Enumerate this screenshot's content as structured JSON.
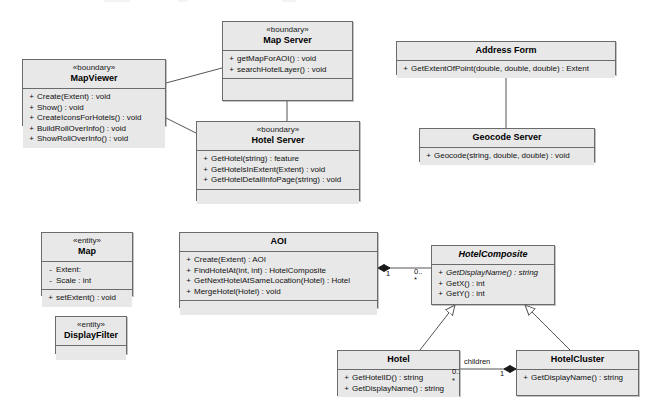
{
  "diagram": {
    "type": "uml-class-diagram",
    "background_color": "#ffffff",
    "class_fill_color": "#e8e8e8",
    "class_border_color": "#6b6b6b",
    "line_color": "#555555"
  },
  "classes": [
    {
      "id": "map_server",
      "name": "Map Server",
      "stereotype": "«boundary»",
      "abstract": false,
      "attributes": [],
      "operations": [
        {
          "visibility": "+",
          "signature": "getMapForAOI() : void"
        },
        {
          "visibility": "+",
          "signature": "searchHotelLayer() : void"
        }
      ],
      "has_empty_compartment": true
    },
    {
      "id": "map_viewer",
      "name": "MapViewer",
      "stereotype": "«boundary»",
      "abstract": false,
      "attributes": [],
      "operations": [
        {
          "visibility": "+",
          "signature": "Create(Extent) : void"
        },
        {
          "visibility": "+",
          "signature": "Show() : void"
        },
        {
          "visibility": "+",
          "signature": "CreateIconsForHotels() : void"
        },
        {
          "visibility": "+",
          "signature": "BuildRollOverInfo() : void"
        },
        {
          "visibility": "+",
          "signature": "ShowRollOverInfo() : void"
        }
      ],
      "has_empty_compartment": false
    },
    {
      "id": "hotel_server",
      "name": "Hotel Server",
      "stereotype": "«boundary»",
      "abstract": false,
      "attributes": [],
      "operations": [
        {
          "visibility": "+",
          "signature": "GetHotel(string) : feature"
        },
        {
          "visibility": "+",
          "signature": "GetHotelsInExtent(Extent) : void"
        },
        {
          "visibility": "+",
          "signature": "GetHotelDetailInfoPage(string) : void"
        }
      ],
      "has_empty_compartment": true
    },
    {
      "id": "address_form",
      "name": "Address Form",
      "stereotype": "",
      "abstract": false,
      "attributes": [],
      "operations": [
        {
          "visibility": "+",
          "signature": "GetExtentOfPoint(double, double, double) : Extent"
        }
      ],
      "has_empty_compartment": false
    },
    {
      "id": "geocode_server",
      "name": "Geocode Server",
      "stereotype": "",
      "abstract": false,
      "attributes": [],
      "operations": [
        {
          "visibility": "+",
          "signature": "Geocode(string, double, double) : void"
        }
      ],
      "has_empty_compartment": false
    },
    {
      "id": "map",
      "name": "Map",
      "stereotype": "«entity»",
      "abstract": false,
      "attributes": [
        {
          "visibility": "-",
          "signature": "Extent:"
        },
        {
          "visibility": "-",
          "signature": "Scale : int"
        }
      ],
      "operations": [
        {
          "visibility": "+",
          "signature": "setExtent() : void"
        }
      ],
      "has_empty_compartment": false
    },
    {
      "id": "display_filter",
      "name": "DisplayFilter",
      "stereotype": "«entity»",
      "abstract": false,
      "attributes": [],
      "operations": [],
      "has_empty_compartment": true
    },
    {
      "id": "aoi",
      "name": "AOI",
      "stereotype": "",
      "abstract": false,
      "attributes": [],
      "operations": [
        {
          "visibility": "+",
          "signature": "Create(Extent) : AOI"
        },
        {
          "visibility": "+",
          "signature": "FindHotelAt(int, int) : HotelComposite"
        },
        {
          "visibility": "+",
          "signature": "GetNextHotelAtSameLocation(Hotel) : Hotel"
        },
        {
          "visibility": "+",
          "signature": "MergeHotel(Hotel) : void"
        }
      ],
      "has_empty_compartment": true
    },
    {
      "id": "hotel_composite",
      "name": "HotelComposite",
      "stereotype": "",
      "abstract": true,
      "attributes": [],
      "operations": [
        {
          "visibility": "+",
          "signature": "GetDisplayName() : string",
          "italic": true
        },
        {
          "visibility": "+",
          "signature": "GetX() : int"
        },
        {
          "visibility": "+",
          "signature": "GetY() : int"
        }
      ],
      "has_empty_compartment": false
    },
    {
      "id": "hotel",
      "name": "Hotel",
      "stereotype": "",
      "abstract": false,
      "attributes": [],
      "operations": [
        {
          "visibility": "+",
          "signature": "GetHotelID() : string"
        },
        {
          "visibility": "+",
          "signature": "GetDisplayName() : string"
        }
      ],
      "has_empty_compartment": false
    },
    {
      "id": "hotel_cluster",
      "name": "HotelCluster",
      "stereotype": "",
      "abstract": false,
      "attributes": [],
      "operations": [
        {
          "visibility": "+",
          "signature": "GetDisplayName() : string"
        }
      ],
      "has_empty_compartment": false
    }
  ],
  "relationships": [
    {
      "id": "r1",
      "from": "map_viewer",
      "to": "map_server",
      "kind": "association",
      "label": "",
      "source_multiplicity": "",
      "target_multiplicity": ""
    },
    {
      "id": "r2",
      "from": "map_viewer",
      "to": "hotel_server",
      "kind": "association",
      "label": "",
      "source_multiplicity": "",
      "target_multiplicity": ""
    },
    {
      "id": "r3",
      "from": "map_server",
      "to": "hotel_server",
      "kind": "association",
      "label": "",
      "source_multiplicity": "",
      "target_multiplicity": ""
    },
    {
      "id": "r4",
      "from": "address_form",
      "to": "geocode_server",
      "kind": "association",
      "label": "",
      "source_multiplicity": "",
      "target_multiplicity": ""
    },
    {
      "id": "r5",
      "from": "aoi",
      "to": "hotel_composite",
      "kind": "composition",
      "label": "",
      "source_multiplicity": "1",
      "target_multiplicity": "0..*"
    },
    {
      "id": "r6",
      "from": "hotel",
      "to": "hotel_composite",
      "kind": "generalization",
      "label": "",
      "source_multiplicity": "",
      "target_multiplicity": ""
    },
    {
      "id": "r7",
      "from": "hotel_cluster",
      "to": "hotel_composite",
      "kind": "generalization",
      "label": "",
      "source_multiplicity": "",
      "target_multiplicity": ""
    },
    {
      "id": "r8",
      "from": "hotel_cluster",
      "to": "hotel",
      "kind": "composition",
      "label": "children",
      "source_multiplicity": "1",
      "target_multiplicity": "0..*"
    }
  ],
  "edge_labels": {
    "aoi_end": "1",
    "hotel_composite_end_top": "0..",
    "hotel_composite_end_bottom": "*",
    "children": "children",
    "hotel_end_top": "0..",
    "hotel_end_bottom": "*",
    "hotel_cluster_end": "1"
  }
}
